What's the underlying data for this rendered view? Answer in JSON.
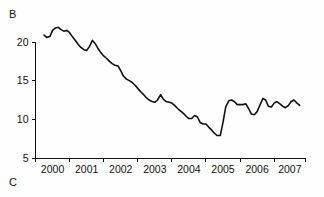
{
  "figure": {
    "panel_label_b": "B",
    "panel_label_c": "C",
    "line_color": "#111111",
    "background_color": "#ffffff"
  },
  "chart_data": {
    "type": "line",
    "title": "",
    "subtitle": "",
    "xlabel": "",
    "ylabel": "",
    "xlim": [
      1999.75,
      2007.67
    ],
    "ylim": [
      5,
      22.6
    ],
    "grid": false,
    "legend": null,
    "y_ticks": [
      5,
      10,
      15,
      20
    ],
    "y_tick_labels": [
      "5",
      "10",
      "15",
      "20"
    ],
    "x_ticks": [
      1999.75,
      2000.75,
      2001.75,
      2002.75,
      2003.75,
      2004.75,
      2005.75,
      2006.75,
      2007.67
    ],
    "x_tick_labels": [
      "2000",
      "2001",
      "2002",
      "2003",
      "2004",
      "2005",
      "2006",
      "2007"
    ],
    "series": [
      {
        "name": "rate",
        "x": [
          2000.0,
          2000.08,
          2000.17,
          2000.25,
          2000.33,
          2000.42,
          2000.5,
          2000.58,
          2000.67,
          2000.75,
          2000.83,
          2000.92,
          2001.0,
          2001.08,
          2001.17,
          2001.25,
          2001.33,
          2001.42,
          2001.5,
          2001.58,
          2001.67,
          2001.75,
          2001.83,
          2001.92,
          2002.0,
          2002.08,
          2002.17,
          2002.25,
          2002.33,
          2002.42,
          2002.5,
          2002.58,
          2002.67,
          2002.75,
          2002.83,
          2002.92,
          2003.0,
          2003.08,
          2003.17,
          2003.25,
          2003.33,
          2003.42,
          2003.5,
          2003.58,
          2003.67,
          2003.75,
          2003.83,
          2003.92,
          2004.0,
          2004.08,
          2004.17,
          2004.25,
          2004.33,
          2004.42,
          2004.5,
          2004.58,
          2004.67,
          2004.75,
          2004.83,
          2004.92,
          2005.0,
          2005.08,
          2005.17,
          2005.25,
          2005.33,
          2005.42,
          2005.5,
          2005.58,
          2005.67,
          2005.75,
          2005.83,
          2005.92,
          2006.0,
          2006.08,
          2006.17,
          2006.25,
          2006.33,
          2006.42,
          2006.5,
          2006.58,
          2006.67,
          2006.75,
          2006.83,
          2006.92,
          2007.0,
          2007.08,
          2007.17,
          2007.25,
          2007.33,
          2007.42,
          2007.5
        ],
        "y": [
          20.9,
          20.6,
          20.7,
          21.5,
          21.8,
          21.9,
          21.6,
          21.4,
          21.5,
          21.2,
          20.7,
          20.2,
          19.7,
          19.3,
          19.0,
          18.9,
          19.4,
          20.2,
          19.8,
          19.2,
          18.6,
          18.2,
          17.9,
          17.5,
          17.2,
          17.0,
          16.9,
          16.3,
          15.6,
          15.2,
          15.0,
          14.8,
          14.4,
          14.0,
          13.6,
          13.2,
          12.8,
          12.5,
          12.3,
          12.2,
          12.5,
          13.2,
          12.6,
          12.3,
          12.2,
          12.1,
          11.8,
          11.4,
          11.1,
          10.8,
          10.4,
          10.1,
          10.1,
          10.5,
          10.3,
          9.6,
          9.4,
          9.4,
          9.0,
          8.6,
          8.2,
          7.9,
          7.9,
          9.6,
          11.6,
          12.4,
          12.5,
          12.3,
          11.9,
          11.9,
          11.9,
          12.0,
          11.4,
          10.7,
          10.6,
          11.0,
          11.8,
          12.7,
          12.5,
          11.7,
          11.6,
          12.1,
          12.3,
          12.0,
          11.7,
          11.5,
          11.8,
          12.3,
          12.5,
          12.1,
          11.8
        ]
      }
    ],
    "annotations": {
      "peak_value": 21.9,
      "peak_x": "2000",
      "minimum_value": 7.9,
      "minimum_x": "2005",
      "end_value": 11.8,
      "end_x": "2007"
    }
  }
}
